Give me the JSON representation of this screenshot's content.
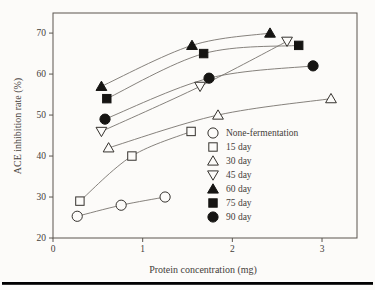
{
  "figure": {
    "background": "#fcfbf9",
    "text_color": "#45403a",
    "axis_color": "#5a554f",
    "line_color": "#78746e",
    "marker_fill_open": "#fcfbf9",
    "marker_fill_solid": "#161513",
    "marker_stroke": "#35322e",
    "bottom_rule_color": "#131311"
  },
  "chart_data": {
    "type": "line",
    "title": "",
    "xlabel": "Protein concentration (mg)",
    "ylabel": "ACE inhibition rate (%)",
    "xlim": [
      0,
      3.39
    ],
    "ylim": [
      20,
      74.9
    ],
    "xticks": [
      "0",
      "1",
      "2",
      "3"
    ],
    "xtick_values": [
      0,
      1,
      2,
      3
    ],
    "yticks": [
      "20",
      "30",
      "40",
      "50",
      "60",
      "70"
    ],
    "ytick_values": [
      20,
      30,
      40,
      50,
      60,
      70
    ],
    "grid": false,
    "legend_position": "inside-right",
    "series": [
      {
        "name": "None-fermentation",
        "marker": "circle-open",
        "points": [
          [
            0.27,
            25.3
          ],
          [
            0.76,
            28.0
          ],
          [
            1.25,
            30.0
          ]
        ]
      },
      {
        "name": "15 day",
        "marker": "square-open",
        "points": [
          [
            0.3,
            29.0
          ],
          [
            0.88,
            40.0
          ],
          [
            1.54,
            46.0
          ]
        ]
      },
      {
        "name": "30 day",
        "marker": "triangle-up-open",
        "points": [
          [
            0.62,
            42.0
          ],
          [
            1.84,
            50.0
          ],
          [
            3.1,
            54.0
          ]
        ]
      },
      {
        "name": "45 day",
        "marker": "triangle-down-open",
        "points": [
          [
            0.54,
            46.0
          ],
          [
            1.64,
            57.0
          ],
          [
            2.61,
            68.0
          ]
        ]
      },
      {
        "name": "60 day",
        "marker": "triangle-up-solid",
        "points": [
          [
            0.54,
            57.0
          ],
          [
            1.55,
            67.0
          ],
          [
            2.42,
            70.0
          ]
        ]
      },
      {
        "name": "75 day",
        "marker": "square-solid",
        "points": [
          [
            0.6,
            54.0
          ],
          [
            1.68,
            65.0
          ],
          [
            2.74,
            67.0
          ]
        ]
      },
      {
        "name": "90 day",
        "marker": "circle-solid",
        "points": [
          [
            0.58,
            49.0
          ],
          [
            1.74,
            59.0
          ],
          [
            2.9,
            62.0
          ]
        ]
      }
    ]
  }
}
